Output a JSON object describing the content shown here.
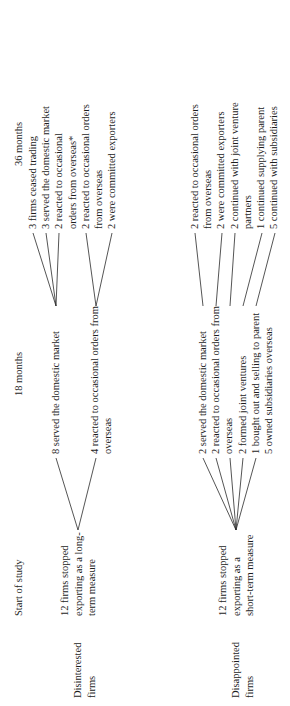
{
  "figure": {
    "type": "flow-diagram",
    "orientation": "rotated-90-ccw",
    "columns": [
      {
        "id": "start",
        "label": "Start of study"
      },
      {
        "id": "m18",
        "label": "18 months"
      },
      {
        "id": "m36",
        "label": "36 months"
      }
    ]
  },
  "groups": [
    {
      "id": "disappointed",
      "label_line1": "Disappointed",
      "label_line2": "firms",
      "start": {
        "line1": "12 firms stopped",
        "line2": "exporting as a",
        "line3": "short-term measure"
      },
      "m18": [
        {
          "text": "2 served the domestic market",
          "cont": ""
        },
        {
          "text": "2 reacted to occasional orders from",
          "cont": "overseas"
        },
        {
          "text": "2 formed joint ventures",
          "cont": ""
        },
        {
          "text": "1 bought out and selling to parent",
          "cont": ""
        },
        {
          "text": "5 owned subsidiaries overseas",
          "cont": ""
        }
      ],
      "m36": [
        {
          "text": "2 reacted to occasional orders",
          "cont": "from overseas"
        },
        {
          "text": "2 were committed exporters",
          "cont": ""
        },
        {
          "text": "2 continued with joint venture",
          "cont": "partners"
        },
        {
          "text": "1 continued supplying parent",
          "cont": ""
        },
        {
          "text": "5 continued with subsidiaries",
          "cont": ""
        }
      ]
    },
    {
      "id": "disinterested",
      "label_line1": "Disinterested",
      "label_line2": "firms",
      "start": {
        "line1": "12 firms stopped",
        "line2": "exporting as a long-",
        "line3": "term measure"
      },
      "m18": [
        {
          "text": "8 served the domestic market",
          "cont": ""
        },
        {
          "text": "4 reacted to occasional orders from",
          "cont": "overseas"
        }
      ],
      "m36": [
        {
          "text": "3 firms ceased trading",
          "cont": ""
        },
        {
          "text": "3 served the domestic market",
          "cont": ""
        },
        {
          "text": "2 reacted to occasional",
          "cont": "orders from overseas*"
        },
        {
          "text": "2 reacted to occasional orders",
          "cont": "from overseas"
        },
        {
          "text": "2 were committed exporters",
          "cont": ""
        }
      ]
    }
  ]
}
